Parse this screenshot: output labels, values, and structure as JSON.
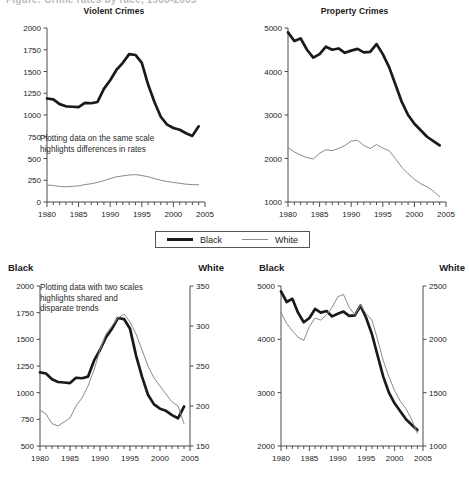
{
  "figure": {
    "cut_caption": "Figure: Crime rates by race, 1980-2005",
    "legend": {
      "entries": [
        {
          "label": "Black",
          "style": "thick-black-line",
          "color": "#1a1a1a"
        },
        {
          "label": "White",
          "style": "thin-gray-line",
          "color": "#8a8a8a"
        }
      ]
    }
  },
  "panels": {
    "top_left": {
      "title": "Violent Crimes",
      "annotation": "Plotting data on the same scale\nhighlights differences in rates"
    },
    "top_right": {
      "title": "Property Crimes",
      "annotation": ""
    },
    "bottom_left": {
      "left_axis_label": "Black",
      "right_axis_label": "White",
      "annotation": "Plotting data with two scales\nhighlights shared and\ndisparate trends"
    },
    "bottom_right": {
      "left_axis_label": "Black",
      "right_axis_label": "White",
      "annotation": ""
    }
  },
  "chart_data": [
    {
      "id": "top_left",
      "type": "line",
      "title": "Violent Crimes",
      "xlabel": "",
      "ylabel": "",
      "xlim": [
        1980,
        2005
      ],
      "ylim": [
        0,
        2000
      ],
      "yticks": [
        0,
        250,
        500,
        750,
        1000,
        1250,
        1500,
        1750,
        2000
      ],
      "xticks": [
        1980,
        1985,
        1990,
        1995,
        2000,
        2005
      ],
      "minor_x_step": 1,
      "grid": false,
      "legend_position": "below-figure",
      "annotation": "Plotting data on the same scale highlights differences in rates",
      "x": [
        1980,
        1981,
        1982,
        1983,
        1984,
        1985,
        1986,
        1987,
        1988,
        1989,
        1990,
        1991,
        1992,
        1993,
        1994,
        1995,
        1996,
        1997,
        1998,
        1999,
        2000,
        2001,
        2002,
        2003,
        2004
      ],
      "series": [
        {
          "name": "Black",
          "values": [
            1190,
            1180,
            1125,
            1100,
            1095,
            1090,
            1140,
            1135,
            1150,
            1300,
            1400,
            1520,
            1600,
            1700,
            1690,
            1600,
            1350,
            1150,
            980,
            890,
            850,
            830,
            790,
            760,
            870
          ]
        },
        {
          "name": "White",
          "values": [
            195,
            190,
            178,
            175,
            180,
            185,
            200,
            210,
            225,
            245,
            270,
            290,
            300,
            310,
            315,
            305,
            290,
            270,
            250,
            235,
            225,
            215,
            205,
            200,
            198
          ]
        }
      ]
    },
    {
      "id": "top_right",
      "type": "line",
      "title": "Property Crimes",
      "xlabel": "",
      "ylabel": "",
      "xlim": [
        1980,
        2005
      ],
      "ylim": [
        1000,
        5000
      ],
      "yticks": [
        1000,
        2000,
        3000,
        4000,
        5000
      ],
      "xticks": [
        1980,
        1985,
        1990,
        1995,
        2000,
        2005
      ],
      "minor_x_step": 1,
      "grid": false,
      "legend_position": "below-figure",
      "x": [
        1980,
        1981,
        1982,
        1983,
        1984,
        1985,
        1986,
        1987,
        1988,
        1989,
        1990,
        1991,
        1992,
        1993,
        1994,
        1995,
        1996,
        1997,
        1998,
        1999,
        2000,
        2001,
        2002,
        2003,
        2004
      ],
      "series": [
        {
          "name": "Black",
          "values": [
            4900,
            4700,
            4760,
            4500,
            4320,
            4400,
            4570,
            4500,
            4530,
            4430,
            4480,
            4520,
            4440,
            4450,
            4630,
            4400,
            4100,
            3700,
            3300,
            3000,
            2800,
            2650,
            2500,
            2400,
            2300
          ]
        },
        {
          "name": "White",
          "values": [
            2250,
            2150,
            2080,
            2020,
            1990,
            2120,
            2200,
            2180,
            2230,
            2300,
            2400,
            2420,
            2300,
            2230,
            2320,
            2240,
            2180,
            2000,
            1800,
            1650,
            1520,
            1420,
            1350,
            1250,
            1120
          ]
        }
      ]
    },
    {
      "id": "bottom_left",
      "type": "line",
      "title": "",
      "left_axis_label": "Black",
      "right_axis_label": "White",
      "xlim": [
        1980,
        2005
      ],
      "ylim_left": [
        500,
        2000
      ],
      "ylim_right": [
        150,
        350
      ],
      "yticks_left": [
        500,
        750,
        1000,
        1250,
        1500,
        1750,
        2000
      ],
      "yticks_right": [
        150,
        200,
        250,
        300,
        350
      ],
      "xticks": [
        1980,
        1985,
        1990,
        1995,
        2000,
        2005
      ],
      "minor_x_step": 1,
      "grid": false,
      "annotation": "Plotting data with two scales highlights shared and disparate trends",
      "x": [
        1980,
        1981,
        1982,
        1983,
        1984,
        1985,
        1986,
        1987,
        1988,
        1989,
        1990,
        1991,
        1992,
        1993,
        1994,
        1995,
        1996,
        1997,
        1998,
        1999,
        2000,
        2001,
        2002,
        2003,
        2004
      ],
      "series": [
        {
          "name": "Black",
          "axis": "left",
          "values": [
            1190,
            1180,
            1125,
            1100,
            1095,
            1090,
            1140,
            1135,
            1150,
            1300,
            1400,
            1520,
            1600,
            1700,
            1690,
            1600,
            1350,
            1150,
            980,
            890,
            850,
            830,
            790,
            760,
            870
          ]
        },
        {
          "name": "White",
          "axis": "right",
          "values": [
            195,
            190,
            178,
            175,
            180,
            185,
            200,
            210,
            225,
            245,
            270,
            290,
            300,
            310,
            315,
            305,
            290,
            270,
            250,
            235,
            225,
            215,
            205,
            200,
            178
          ]
        }
      ]
    },
    {
      "id": "bottom_right",
      "type": "line",
      "title": "",
      "left_axis_label": "Black",
      "right_axis_label": "White",
      "xlim": [
        1980,
        2005
      ],
      "ylim_left": [
        2000,
        5000
      ],
      "ylim_right": [
        1000,
        2500
      ],
      "yticks_left": [
        2000,
        3000,
        4000,
        5000
      ],
      "yticks_right": [
        1000,
        1500,
        2000,
        2500
      ],
      "xticks": [
        1980,
        1985,
        1990,
        1995,
        2000,
        2005
      ],
      "minor_x_step": 1,
      "grid": false,
      "x": [
        1980,
        1981,
        1982,
        1983,
        1984,
        1985,
        1986,
        1987,
        1988,
        1989,
        1990,
        1991,
        1992,
        1993,
        1994,
        1995,
        1996,
        1997,
        1998,
        1999,
        2000,
        2001,
        2002,
        2003,
        2004
      ],
      "series": [
        {
          "name": "Black",
          "axis": "left",
          "values": [
            4900,
            4700,
            4760,
            4500,
            4320,
            4400,
            4570,
            4500,
            4530,
            4430,
            4480,
            4520,
            4440,
            4450,
            4630,
            4400,
            4100,
            3700,
            3300,
            3000,
            2800,
            2650,
            2500,
            2400,
            2300
          ]
        },
        {
          "name": "White",
          "axis": "right",
          "values": [
            2250,
            2150,
            2080,
            2020,
            1990,
            2120,
            2200,
            2180,
            2230,
            2300,
            2400,
            2420,
            2300,
            2230,
            2320,
            2240,
            2180,
            2000,
            1800,
            1650,
            1520,
            1420,
            1350,
            1250,
            1120
          ]
        }
      ]
    }
  ]
}
